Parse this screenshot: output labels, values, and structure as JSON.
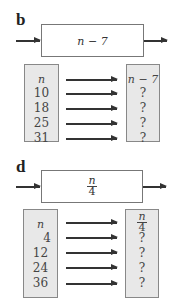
{
  "panels": [
    {
      "label": "b",
      "machine_expression": "n − 7",
      "input_header": "n",
      "output_header": "n − 7",
      "inputs": [
        "10",
        "18",
        "25",
        "31"
      ],
      "outputs": [
        "?",
        "?",
        "?",
        "?"
      ]
    },
    {
      "label": "d",
      "machine_expression": {
        "numerator": "n",
        "denominator": "4"
      },
      "input_header": "n",
      "output_header": {
        "numerator": "n",
        "denominator": "4"
      },
      "inputs": [
        "4",
        "12",
        "24",
        "36"
      ],
      "outputs": [
        "?",
        "?",
        "?",
        "?"
      ]
    }
  ],
  "colors": {
    "column_fill": "#e8e8e8",
    "border": "#777777",
    "arrow": "#333333"
  }
}
